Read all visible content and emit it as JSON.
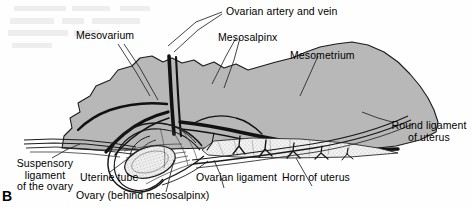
{
  "figure": {
    "panel_letter": "B",
    "kind": "anatomical-line-drawing"
  },
  "labels": {
    "mesovarium": "Mesovarium",
    "ovarian_artery_and_vein": "Ovarian artery and vein",
    "mesosalpinx": "Mesosalpinx",
    "mesometrium": "Mesometrium",
    "round_ligament_line1": "Round ligament",
    "round_ligament_line2": "of uterus",
    "suspensory_line1": "Suspensory",
    "suspensory_line2": "ligament",
    "suspensory_line3": "of the ovary",
    "uterine_tube": "Uterine tube",
    "ovary": "Ovary (behind mesosalpinx)",
    "ovarian_ligament": "Ovarian ligament",
    "horn_of_uterus": "Horn of uterus"
  },
  "colors": {
    "background": "#fefefe",
    "membrane_fill": "#b8b8b8",
    "membrane_stroke": "#1a1a1a",
    "vessel": "#111111",
    "stipple": "#e8e8e8",
    "leader": "#222222",
    "text": "#000000"
  }
}
